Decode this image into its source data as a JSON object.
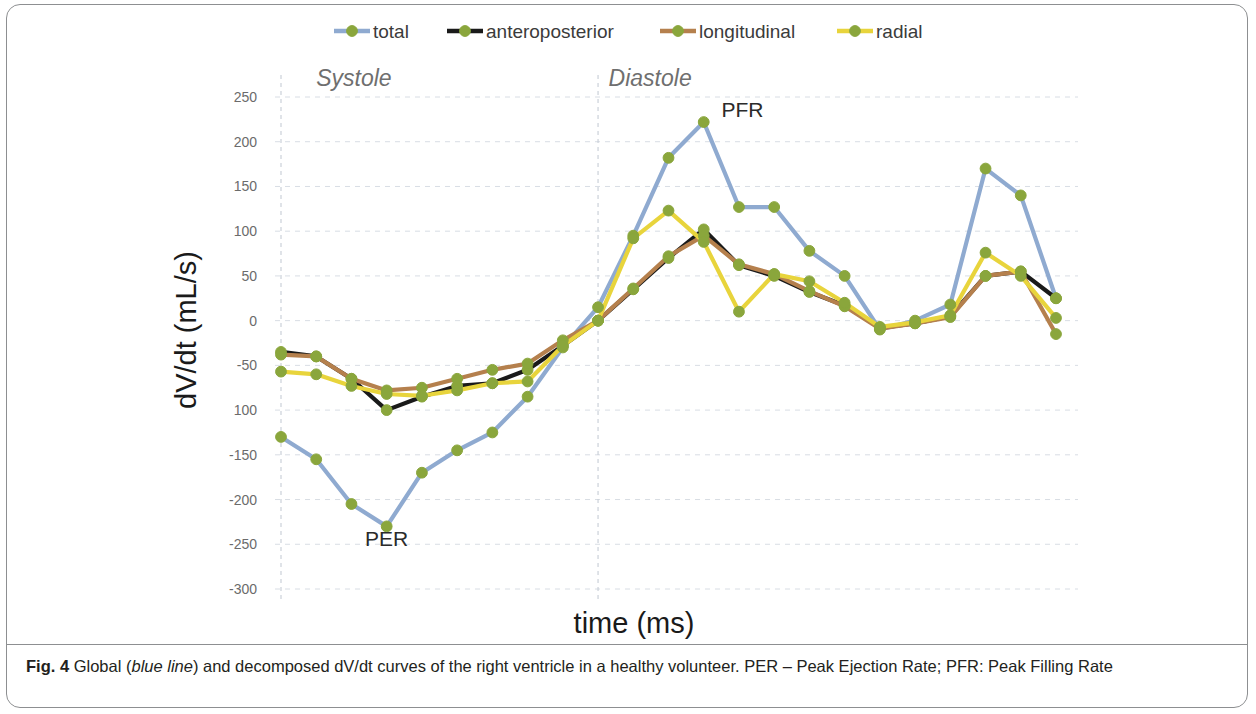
{
  "figure": {
    "caption_label": "Fig. 4",
    "caption_part1": " Global (",
    "caption_italic1": "blue line",
    "caption_part2": ") and decomposed dV/dt curves of the right ventricle in a healthy volunteer. PER – Peak Ejection Rate; PFR: Peak Filling Rate"
  },
  "chart_data": {
    "type": "line",
    "title": "",
    "xlabel": "time (ms)",
    "ylabel": "dV/dt (mL/s)",
    "ylim": [
      -300,
      250
    ],
    "yticks": [
      250,
      200,
      150,
      100,
      50,
      0,
      -50,
      -100,
      -150,
      -200,
      -250,
      -300
    ],
    "ytick_labels": [
      "250",
      "200",
      "150",
      "100",
      "50",
      "0",
      "-50",
      "100",
      "-150",
      "-200",
      "-250",
      "-300"
    ],
    "xlim": [
      0,
      22
    ],
    "grid": true,
    "grid_axis": "y",
    "legend_position": "top",
    "x": [
      0,
      1,
      2,
      3,
      4,
      5,
      6,
      7,
      8,
      9,
      10,
      11,
      12,
      13,
      14,
      15,
      16,
      17,
      18,
      19,
      20,
      21,
      22
    ],
    "series": [
      {
        "name": "total",
        "color": "#8faad0",
        "marker_color": "#8aa63c",
        "values": [
          -130,
          -155,
          -205,
          -230,
          -170,
          -145,
          -125,
          -85,
          -30,
          15,
          95,
          182,
          222,
          127,
          127,
          78,
          50,
          -10,
          0,
          18,
          170,
          140,
          25
        ]
      },
      {
        "name": "anteroposterior",
        "color": "#1a1a1a",
        "marker_color": "#8aa63c",
        "values": [
          -35,
          -40,
          -65,
          -100,
          -85,
          -73,
          -70,
          -55,
          -28,
          0,
          35,
          70,
          102,
          62,
          50,
          32,
          17,
          -8,
          -3,
          5,
          50,
          55,
          25
        ]
      },
      {
        "name": "longitudinal",
        "color": "#b5804d",
        "marker_color": "#8aa63c",
        "values": [
          -38,
          -40,
          -65,
          -78,
          -75,
          -65,
          -55,
          -48,
          -22,
          0,
          36,
          72,
          95,
          63,
          52,
          33,
          16,
          -9,
          -3,
          4,
          50,
          55,
          -15
        ]
      },
      {
        "name": "radial",
        "color": "#e8d43c",
        "marker_color": "#8aa63c",
        "values": [
          -57,
          -60,
          -73,
          -82,
          -84,
          -78,
          -70,
          -68,
          -28,
          0,
          92,
          123,
          88,
          10,
          52,
          44,
          20,
          -7,
          -2,
          6,
          76,
          50,
          3
        ]
      }
    ],
    "annotations": [
      {
        "text": "PER",
        "x": 3,
        "y": -252
      },
      {
        "text": "PFR",
        "x": 13.1,
        "y": 228
      },
      {
        "text": "Systole",
        "x": 1.0,
        "y": 262,
        "style": "italic"
      },
      {
        "text": "Diastole",
        "x": 9.3,
        "y": 262,
        "style": "italic"
      }
    ],
    "phase_dividers": [
      {
        "label": "systole-start",
        "x": 0
      },
      {
        "label": "diastole-start",
        "x": 9
      }
    ]
  }
}
